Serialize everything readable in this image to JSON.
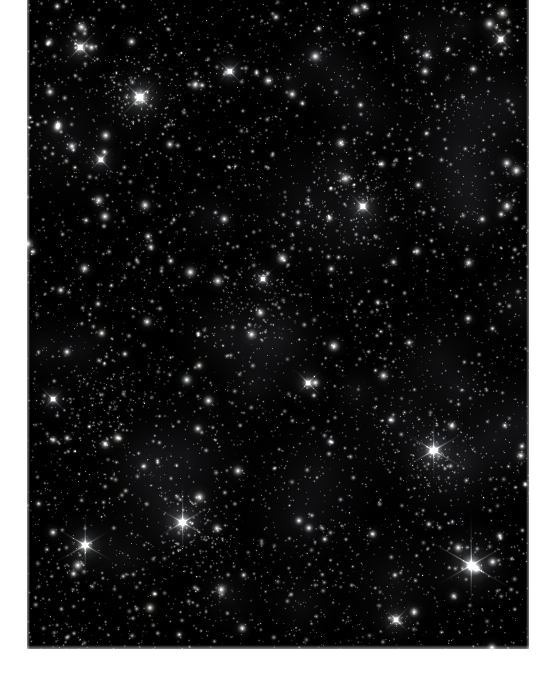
{
  "page": {
    "background_color": "#ffffff",
    "width": 557,
    "height": 674
  },
  "figure": {
    "name": "star-field-image",
    "caption": "",
    "type": "astronomical-photograph",
    "background_color": "#000000",
    "frame": {
      "x": 27,
      "y": 0,
      "width": 502,
      "height": 649
    }
  },
  "image_data": {
    "type": "starfield",
    "description": "Dense field of unresolved and resolved stars, monochrome with faint warm tints; several bright foreground stars show 4- to 6-point diffraction spikes.",
    "seed": 20240517,
    "faint_star_count": 5200,
    "mid_star_count": 900,
    "bright_star_count": 120,
    "star_color_palette": [
      "#ffffff",
      "#f6f4ee",
      "#efe9dd",
      "#e6e9f2",
      "#fff6e6",
      "#dfe6f0"
    ],
    "background_glow_color": "#0a0a0c",
    "spike_stars": [
      {
        "x": 0.225,
        "y": 0.15,
        "radius": 10.5,
        "spikes": 4,
        "spike_length": 34,
        "brightness": 0.95
      },
      {
        "x": 0.31,
        "y": 0.805,
        "radius": 9.5,
        "spikes": 6,
        "spike_length": 40,
        "brightness": 0.98
      },
      {
        "x": 0.885,
        "y": 0.871,
        "radius": 11.0,
        "spikes": 6,
        "spike_length": 52,
        "brightness": 1.0
      },
      {
        "x": 0.116,
        "y": 0.84,
        "radius": 8.5,
        "spikes": 6,
        "spike_length": 34,
        "brightness": 0.92
      },
      {
        "x": 0.81,
        "y": 0.694,
        "radius": 9.0,
        "spikes": 6,
        "spike_length": 38,
        "brightness": 0.96
      },
      {
        "x": 0.106,
        "y": 0.073,
        "radius": 7.5,
        "spikes": 4,
        "spike_length": 26,
        "brightness": 0.88
      },
      {
        "x": 0.404,
        "y": 0.11,
        "radius": 6.5,
        "spikes": 4,
        "spike_length": 22,
        "brightness": 0.84
      },
      {
        "x": 0.669,
        "y": 0.318,
        "radius": 7.0,
        "spikes": 4,
        "spike_length": 24,
        "brightness": 0.86
      },
      {
        "x": 0.147,
        "y": 0.246,
        "radius": 6.0,
        "spikes": 4,
        "spike_length": 20,
        "brightness": 0.82
      },
      {
        "x": 0.56,
        "y": 0.59,
        "radius": 6.2,
        "spikes": 4,
        "spike_length": 21,
        "brightness": 0.83
      },
      {
        "x": 0.944,
        "y": 0.06,
        "radius": 6.0,
        "spikes": 4,
        "spike_length": 20,
        "brightness": 0.8
      },
      {
        "x": 0.735,
        "y": 0.955,
        "radius": 6.5,
        "spikes": 4,
        "spike_length": 22,
        "brightness": 0.85
      },
      {
        "x": 0.052,
        "y": 0.615,
        "radius": 5.8,
        "spikes": 4,
        "spike_length": 19,
        "brightness": 0.79
      },
      {
        "x": 0.47,
        "y": 0.43,
        "radius": 5.5,
        "spikes": 4,
        "spike_length": 18,
        "brightness": 0.78
      }
    ],
    "clusters": [
      {
        "x": 0.22,
        "y": 0.15,
        "radius": 46,
        "count": 120
      },
      {
        "x": 0.65,
        "y": 0.3,
        "radius": 52,
        "count": 130
      },
      {
        "x": 0.15,
        "y": 0.62,
        "radius": 44,
        "count": 110
      },
      {
        "x": 0.8,
        "y": 0.7,
        "radius": 48,
        "count": 120
      },
      {
        "x": 0.45,
        "y": 0.47,
        "radius": 40,
        "count": 95
      },
      {
        "x": 0.35,
        "y": 0.83,
        "radius": 42,
        "count": 100
      }
    ]
  }
}
